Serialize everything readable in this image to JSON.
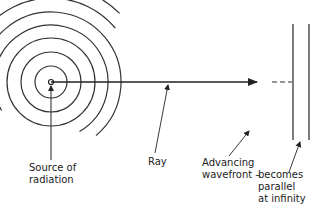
{
  "diagram": {
    "source": {
      "cx": 51,
      "cy": 82
    },
    "full_circle_radii": [
      16,
      30,
      44
    ],
    "partial_arcs": [
      {
        "r": 57,
        "from_deg": 150,
        "to_deg": 420
      },
      {
        "r": 70,
        "from_deg": 140,
        "to_deg": 410
      },
      {
        "r": 84,
        "from_deg": 220,
        "to_deg": 320
      },
      {
        "r": 97,
        "from_deg": 225,
        "to_deg": 315
      },
      {
        "r": 112,
        "from_deg": 230,
        "to_deg": 312
      },
      {
        "r": 129,
        "from_deg": 235,
        "to_deg": 308
      },
      {
        "r": 148,
        "from_deg": 240,
        "to_deg": 305
      },
      {
        "r": 167,
        "from_deg": 243,
        "to_deg": 302
      },
      {
        "r": 181,
        "from_deg": 246,
        "to_deg": 300
      },
      {
        "r": 198,
        "from_deg": 248,
        "to_deg": 298
      },
      {
        "r": 211,
        "from_deg": 250,
        "to_deg": 296
      }
    ],
    "ray": {
      "x1": 51,
      "y1": 82,
      "x2": 257,
      "y2": 82
    },
    "dashes": {
      "x1": 272,
      "x2": 292,
      "y": 82
    },
    "plane_wavefronts": [
      {
        "x": 293,
        "y1": 24,
        "y2": 140
      },
      {
        "x": 309,
        "y1": 24,
        "y2": 140
      }
    ],
    "stroke_color": "#333333"
  },
  "labels": {
    "source_line1": "Source of",
    "source_line2": "radiation",
    "ray": "Ray",
    "advancing_line1": "Advancing",
    "advancing_line2": "wavefront –",
    "parallel_line1": "becomes",
    "parallel_line2": "parallel",
    "parallel_line3": "at infinity"
  }
}
